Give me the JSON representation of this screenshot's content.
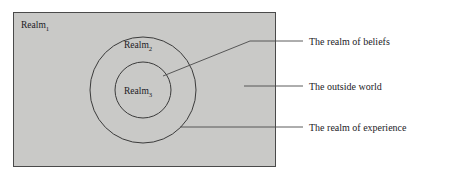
{
  "diagram": {
    "background_color": "#ffffff",
    "rect_fill": "#c9c9c7",
    "stroke_color": "#3b3b3b",
    "regions": [
      {
        "id": "realm1",
        "shape": "rectangle",
        "label_text": "Realm",
        "label_subscript": "1",
        "legend": "The outside world"
      },
      {
        "id": "realm2",
        "shape": "circle",
        "label_text": "Realm",
        "label_subscript": "2",
        "legend": "The realm of experience"
      },
      {
        "id": "realm3",
        "shape": "circle",
        "label_text": "Realm",
        "label_subscript": "3",
        "legend": "The realm of beliefs"
      }
    ],
    "legend": [
      {
        "id": "beliefs",
        "text": "The realm of beliefs"
      },
      {
        "id": "outside-world",
        "text": "The outside world"
      },
      {
        "id": "experience",
        "text": "The realm of experience"
      }
    ]
  }
}
